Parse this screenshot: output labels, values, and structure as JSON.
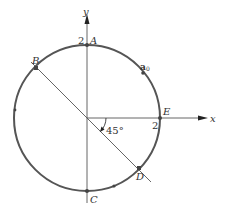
{
  "diagram": {
    "type": "circle-on-axes",
    "axes": {
      "x_label": "x",
      "y_label": "y"
    },
    "circle": {
      "radius_label": "2",
      "color": "#555555"
    },
    "tick_labels": {
      "y_tick": "2",
      "x_tick": "2"
    },
    "points": {
      "A": "A",
      "B": "B",
      "C": "C",
      "D": "D",
      "E": "E"
    },
    "a0_label": "a",
    "a0_sub": "0",
    "angle_label": "45°"
  }
}
